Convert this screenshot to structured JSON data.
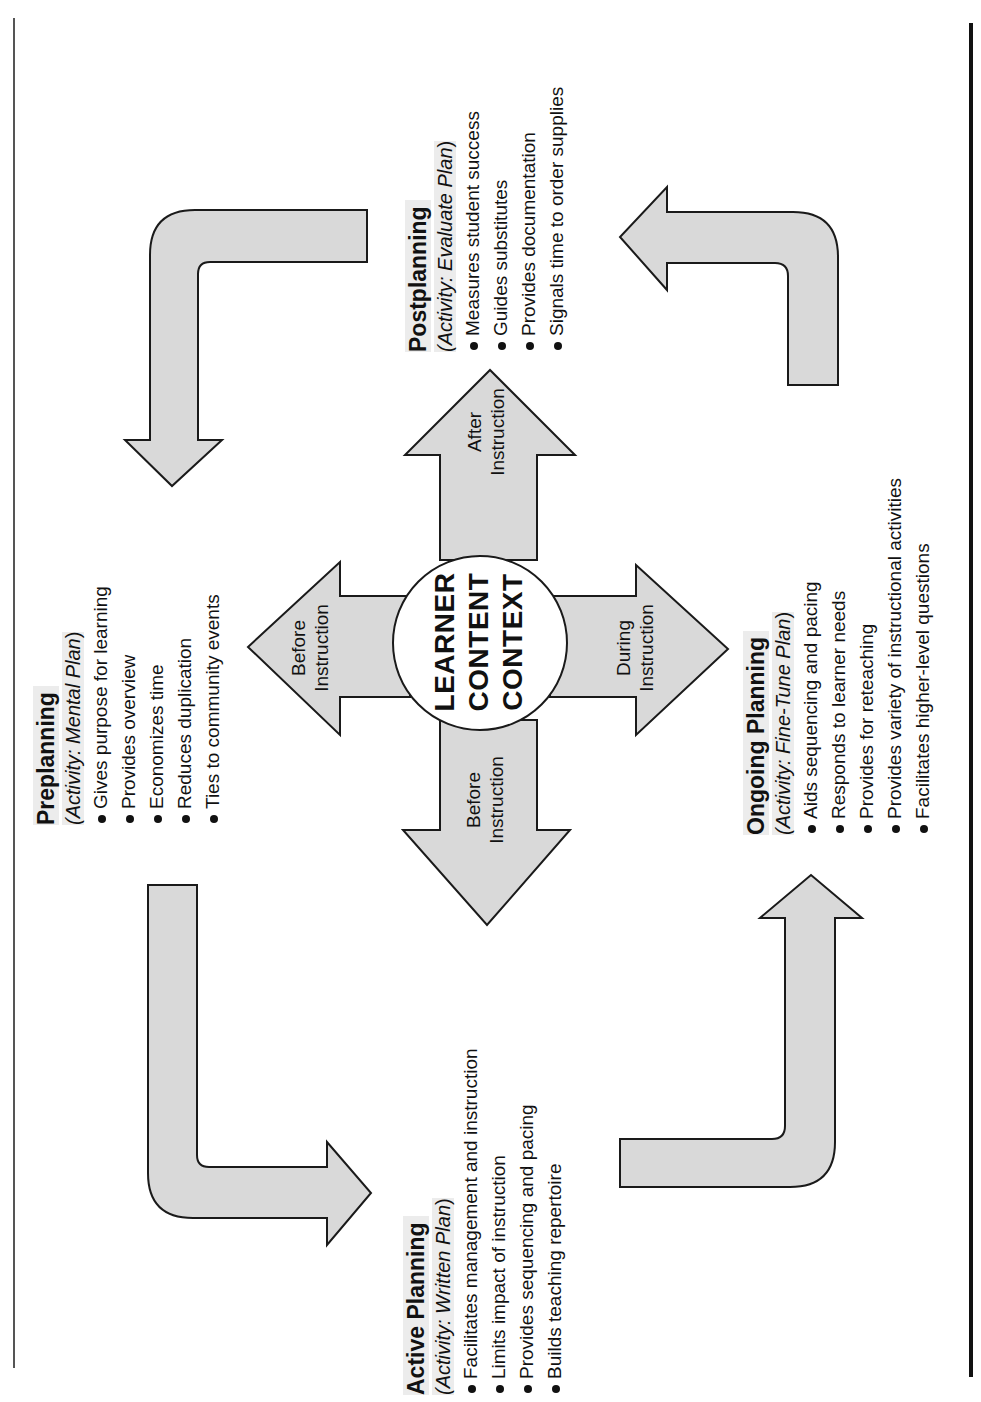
{
  "orientation": "rotated-90-ccw",
  "colors": {
    "arrow_fill": "#d9d9d9",
    "outline": "#1a1a1a",
    "highlight": "#ececec"
  },
  "center": {
    "lines": [
      "LEARNER",
      "CONTENT",
      "CONTEXT"
    ]
  },
  "cross_arrows": {
    "up": {
      "line1": "After",
      "line2": "Instruction"
    },
    "left": {
      "line1": "Before",
      "line2": "Instruction"
    },
    "right": {
      "line1": "During",
      "line2": "Instruction"
    },
    "down": {
      "line1": "Before",
      "line2": "Instruction"
    }
  },
  "stages": {
    "preplanning": {
      "title": "Preplanning",
      "activity_prefix": "(Activity: ",
      "activity_name": "Mental Plan",
      "activity_suffix": ")",
      "bullets": [
        "Gives purpose for learning",
        "Provides overview",
        "Economizes time",
        "Reduces duplication",
        "Ties to community events"
      ]
    },
    "active_planning": {
      "title": "Active Planning",
      "activity_prefix": "(Activity: ",
      "activity_name": "Written Plan",
      "activity_suffix": ")",
      "bullets": [
        "Facilitates management and instruction",
        "Limits impact of instruction",
        "Provides sequencing and pacing",
        "Builds teaching repertoire"
      ]
    },
    "ongoing_planning": {
      "title": "Ongoing Planning",
      "activity_prefix": "(Activity: ",
      "activity_name": "Fine-Tune Plan",
      "activity_suffix": ")",
      "bullets": [
        "Aids sequencing and pacing",
        "Responds to learner needs",
        "Provides for reteaching",
        "Provides variety of instructional activities",
        "Facilitates higher-level questions"
      ]
    },
    "postplanning": {
      "title": "Postplanning",
      "activity_prefix": "(Activity: ",
      "activity_name": "Evaluate Plan",
      "activity_suffix": ")",
      "bullets": [
        "Measures student success",
        "Guides substitutes",
        "Provides documentation",
        "Signals time to order supplies"
      ]
    }
  }
}
